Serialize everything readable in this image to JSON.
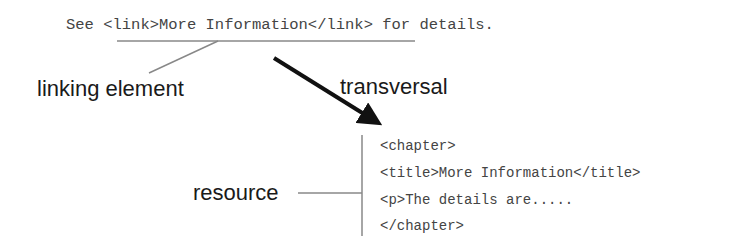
{
  "source": {
    "sentence": "See <link>More Information</link> for details."
  },
  "labels": {
    "linking_element": "linking element",
    "transversal": "transversal",
    "resource": "resource"
  },
  "resource_code": {
    "lines": [
      "<chapter>",
      "<title>More Information</title>",
      "<p>The details are.....",
      "</chapter>"
    ]
  },
  "colors": {
    "text": "#1a1a1a",
    "code_text": "#444444",
    "connector": "#888888",
    "arrow": "#111111"
  }
}
